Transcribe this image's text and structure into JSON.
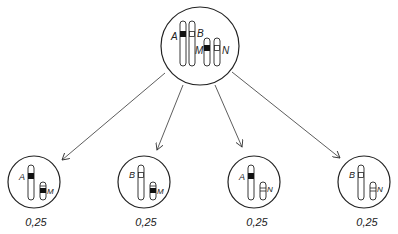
{
  "diagram": {
    "type": "meiosis-gamete-segregation",
    "parent_cell": {
      "chromosomes": [
        {
          "label": "A",
          "length": "long",
          "marker": "filled"
        },
        {
          "label": "B",
          "length": "long",
          "marker": "open"
        },
        {
          "label": "M",
          "length": "short",
          "marker": "filled"
        },
        {
          "label": "N",
          "length": "short",
          "marker": "open"
        }
      ]
    },
    "gametes": [
      {
        "long_label": "A",
        "long_marker": "filled",
        "short_label": "M",
        "short_marker": "filled",
        "probability": "0,25"
      },
      {
        "long_label": "B",
        "long_marker": "open",
        "short_label": "M",
        "short_marker": "filled",
        "probability": "0,25"
      },
      {
        "long_label": "A",
        "long_marker": "filled",
        "short_label": "N",
        "short_marker": "open",
        "probability": "0,25"
      },
      {
        "long_label": "B",
        "long_marker": "open",
        "short_label": "N",
        "short_marker": "open",
        "probability": "0,25"
      }
    ],
    "colors": {
      "line": "#222222",
      "background": "#ffffff"
    }
  }
}
